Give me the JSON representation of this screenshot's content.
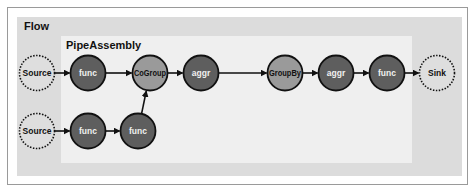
{
  "flow": {
    "label": "Flow"
  },
  "pipe_assembly": {
    "label": "PipeAssembly"
  },
  "nodes": [
    {
      "id": "source1",
      "label": "Source",
      "type": "source",
      "cx": 37,
      "cy": 73
    },
    {
      "id": "func1",
      "label": "func",
      "type": "func",
      "cx": 88,
      "cy": 73
    },
    {
      "id": "cogroup",
      "label": "CoGroup",
      "type": "group",
      "cx": 150,
      "cy": 73
    },
    {
      "id": "aggr1",
      "label": "aggr",
      "type": "func",
      "cx": 201,
      "cy": 73
    },
    {
      "id": "groupby",
      "label": "GroupBy",
      "type": "group",
      "cx": 285,
      "cy": 73
    },
    {
      "id": "aggr2",
      "label": "aggr",
      "type": "func",
      "cx": 336,
      "cy": 73
    },
    {
      "id": "func4",
      "label": "func",
      "type": "func",
      "cx": 387,
      "cy": 73
    },
    {
      "id": "sink",
      "label": "Sink",
      "type": "sink",
      "cx": 437,
      "cy": 73
    },
    {
      "id": "source2",
      "label": "Source",
      "type": "source",
      "cx": 37,
      "cy": 131
    },
    {
      "id": "func2",
      "label": "func",
      "type": "func",
      "cx": 88,
      "cy": 131
    },
    {
      "id": "func3",
      "label": "func",
      "type": "func",
      "cx": 138,
      "cy": 131
    }
  ],
  "edges": [
    {
      "from": "source1",
      "to": "func1"
    },
    {
      "from": "func1",
      "to": "cogroup"
    },
    {
      "from": "cogroup",
      "to": "aggr1"
    },
    {
      "from": "aggr1",
      "to": "groupby"
    },
    {
      "from": "groupby",
      "to": "aggr2"
    },
    {
      "from": "aggr2",
      "to": "func4"
    },
    {
      "from": "func4",
      "to": "sink"
    },
    {
      "from": "source2",
      "to": "func2"
    },
    {
      "from": "func2",
      "to": "func3"
    },
    {
      "from": "func3",
      "to": "cogroup"
    }
  ],
  "colors": {
    "func_fill": "#5e5e5e",
    "group_fill": "#9a9a9a",
    "endpoint_fill": "#dedede",
    "stroke": "#111111",
    "func_text": "#f0f0f0",
    "dark_text": "#111111"
  }
}
